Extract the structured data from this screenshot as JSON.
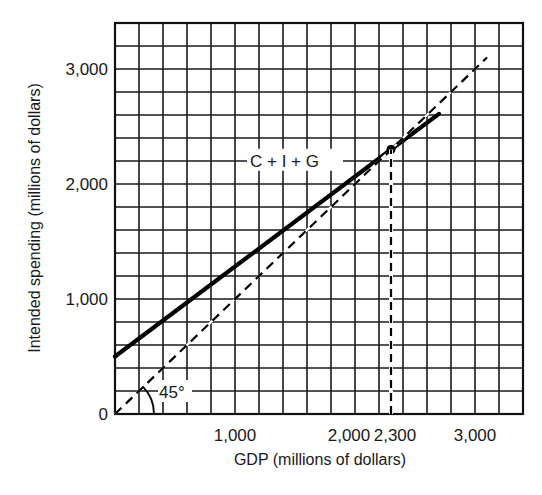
{
  "chart_data": {
    "type": "line",
    "title": "",
    "xlabel": "GDP (millions of dollars)",
    "ylabel": "Intended spending (millions of dollars)",
    "xlim": [
      0,
      3400
    ],
    "ylim": [
      0,
      3400
    ],
    "grid": true,
    "grid_step": 200,
    "x_ticks": [
      {
        "value": 1000,
        "label": "1,000"
      },
      {
        "value": 2000,
        "label": "2,000"
      },
      {
        "value": 2300,
        "label": "2,300"
      },
      {
        "value": 3000,
        "label": "3,000"
      }
    ],
    "y_ticks": [
      {
        "value": 0,
        "label": "0"
      },
      {
        "value": 1000,
        "label": "1,000"
      },
      {
        "value": 2000,
        "label": "2,000"
      },
      {
        "value": 3000,
        "label": "3,000"
      }
    ],
    "series": [
      {
        "name": "C + I + G",
        "style": "solid-thick",
        "points": [
          [
            0,
            500
          ],
          [
            2300,
            2300
          ],
          [
            2700,
            2610
          ]
        ]
      },
      {
        "name": "45° line",
        "style": "dashed",
        "points": [
          [
            0,
            0
          ],
          [
            3100,
            3100
          ]
        ]
      }
    ],
    "annotations": [
      {
        "type": "point",
        "x": 2300,
        "y": 2300,
        "label": "Equilibrium"
      },
      {
        "type": "vline-dashed",
        "x": 2300,
        "from_y": 0,
        "to_y": 2300
      },
      {
        "type": "angle-arc",
        "label": "45°",
        "x": 0,
        "y": 0
      },
      {
        "type": "text",
        "label": "C + I + G",
        "x": 1150,
        "y": 2150
      }
    ],
    "legend": "none"
  }
}
